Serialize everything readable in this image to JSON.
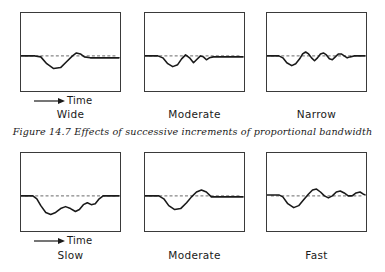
{
  "figure": {
    "caption": "Figure 14.7 Effects of successive increments of proportional bandwidth",
    "time_axis_label": "Time",
    "arrow_icon": "right-arrow-icon",
    "stroke_color": "#1a1a1a",
    "baseline_color": "#555555",
    "panel_border_color": "#3a3a3a",
    "background_color": "#ffffff"
  },
  "chart_data": {
    "type": "line",
    "title": "Figure 14.7 Effects of successive increments of proportional bandwidth",
    "xlabel": "Time",
    "ylabel": "",
    "grid": false,
    "legend": "none",
    "xlim": [
      0,
      100
    ],
    "ylim": [
      0,
      80
    ],
    "baseline_y": 44,
    "baseline_style": "dashed",
    "rows": [
      {
        "row_name": "proportional-bandwidth",
        "panels": [
          {
            "label": "Wide",
            "description": "Single broad undershoot dip with small overshoot, then flat",
            "points": [
              [
                0,
                44
              ],
              [
                14,
                44
              ],
              [
                20,
                45
              ],
              [
                26,
                52
              ],
              [
                33,
                57
              ],
              [
                40,
                56
              ],
              [
                46,
                50
              ],
              [
                52,
                44
              ],
              [
                56,
                41
              ],
              [
                60,
                42
              ],
              [
                64,
                45
              ],
              [
                70,
                46
              ],
              [
                82,
                46
              ],
              [
                99,
                46
              ]
            ]
          },
          {
            "label": "Moderate",
            "description": "Dip followed by two decaying ripples, then flat",
            "points": [
              [
                0,
                44
              ],
              [
                13,
                44
              ],
              [
                18,
                46
              ],
              [
                23,
                52
              ],
              [
                28,
                55
              ],
              [
                33,
                53
              ],
              [
                37,
                47
              ],
              [
                41,
                43
              ],
              [
                45,
                46
              ],
              [
                49,
                51
              ],
              [
                52,
                48
              ],
              [
                56,
                44
              ],
              [
                59,
                45
              ],
              [
                62,
                48
              ],
              [
                65,
                46
              ],
              [
                69,
                45
              ],
              [
                74,
                45
              ],
              [
                86,
                45
              ],
              [
                99,
                45
              ]
            ]
          },
          {
            "label": "Narrow",
            "description": "Dip followed by four sustained ripples that persist to the right edge",
            "points": [
              [
                0,
                44
              ],
              [
                12,
                44
              ],
              [
                16,
                46
              ],
              [
                20,
                51
              ],
              [
                25,
                54
              ],
              [
                29,
                52
              ],
              [
                33,
                47
              ],
              [
                36,
                42
              ],
              [
                39,
                40
              ],
              [
                42,
                42
              ],
              [
                45,
                46
              ],
              [
                48,
                49
              ],
              [
                51,
                46
              ],
              [
                54,
                42
              ],
              [
                57,
                41
              ],
              [
                60,
                43
              ],
              [
                63,
                47
              ],
              [
                66,
                48
              ],
              [
                69,
                45
              ],
              [
                72,
                42
              ],
              [
                75,
                42
              ],
              [
                78,
                44
              ],
              [
                81,
                46
              ],
              [
                84,
                45
              ],
              [
                88,
                44
              ],
              [
                92,
                44
              ],
              [
                99,
                44
              ]
            ]
          }
        ]
      },
      {
        "row_name": "response-speed",
        "panels": [
          {
            "label": "Slow",
            "description": "Deep prolonged undershoot with slow stepped recovery back to baseline",
            "points": [
              [
                0,
                44
              ],
              [
                12,
                44
              ],
              [
                16,
                47
              ],
              [
                20,
                54
              ],
              [
                25,
                61
              ],
              [
                30,
                63
              ],
              [
                35,
                61
              ],
              [
                40,
                57
              ],
              [
                45,
                55
              ],
              [
                50,
                57
              ],
              [
                55,
                60
              ],
              [
                59,
                58
              ],
              [
                63,
                53
              ],
              [
                67,
                51
              ],
              [
                71,
                53
              ],
              [
                75,
                52
              ],
              [
                79,
                47
              ],
              [
                83,
                44
              ],
              [
                88,
                44
              ],
              [
                99,
                44
              ]
            ]
          },
          {
            "label": "Moderate",
            "description": "Single dip followed by one smooth overshoot bump above baseline",
            "points": [
              [
                0,
                44
              ],
              [
                14,
                44
              ],
              [
                19,
                47
              ],
              [
                24,
                54
              ],
              [
                30,
                58
              ],
              [
                36,
                57
              ],
              [
                42,
                51
              ],
              [
                47,
                45
              ],
              [
                52,
                40
              ],
              [
                57,
                38
              ],
              [
                62,
                40
              ],
              [
                67,
                45
              ],
              [
                72,
                45
              ],
              [
                80,
                45
              ],
              [
                99,
                45
              ]
            ]
          },
          {
            "label": "Fast",
            "description": "Dip then several decaying oscillations about the baseline",
            "points": [
              [
                0,
                43
              ],
              [
                12,
                43
              ],
              [
                16,
                45
              ],
              [
                21,
                52
              ],
              [
                27,
                56
              ],
              [
                32,
                54
              ],
              [
                37,
                48
              ],
              [
                42,
                42
              ],
              [
                46,
                38
              ],
              [
                50,
                37
              ],
              [
                54,
                40
              ],
              [
                58,
                44
              ],
              [
                62,
                46
              ],
              [
                66,
                44
              ],
              [
                70,
                40
              ],
              [
                74,
                39
              ],
              [
                78,
                41
              ],
              [
                82,
                44
              ],
              [
                86,
                44
              ],
              [
                90,
                41
              ],
              [
                94,
                40
              ],
              [
                97,
                42
              ],
              [
                99,
                43
              ]
            ]
          }
        ]
      }
    ]
  },
  "labels": {
    "top_row": [
      "Wide",
      "Moderate",
      "Narrow"
    ],
    "bottom_row": [
      "Slow",
      "Moderate",
      "Fast"
    ]
  }
}
